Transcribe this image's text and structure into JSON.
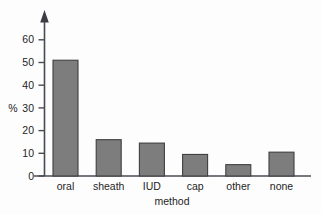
{
  "chart_data": {
    "type": "bar",
    "title": "",
    "subtitle": "",
    "xlabel": "method",
    "ylabel": "%",
    "categories": [
      "oral",
      "sheath",
      "IUD",
      "cap",
      "other",
      "none"
    ],
    "values": [
      51,
      16,
      14.5,
      9.5,
      5,
      10.5
    ],
    "series": [
      {
        "name": "percent",
        "values": [
          51,
          16,
          14.5,
          9.5,
          5,
          10.5
        ]
      }
    ],
    "ylim": [
      0,
      65
    ],
    "yticks": [
      0,
      10,
      20,
      30,
      40,
      50,
      60
    ],
    "ytick_labels": [
      "0",
      "10",
      "20",
      "30",
      "40",
      "50",
      "60"
    ],
    "xtick_labels": [
      "oral",
      "sheath",
      "IUD",
      "cap",
      "other",
      "none"
    ],
    "grid": false,
    "legend": null,
    "legend_position": "none",
    "annotations": [],
    "style": {
      "bar_fill": "#7d7d7d",
      "bar_edge": "#3f3f42",
      "axis_color": "#4a4a52",
      "text_color": "#1d1d1d",
      "background": "#fdfdfd",
      "y_axis_arrow": true
    }
  }
}
